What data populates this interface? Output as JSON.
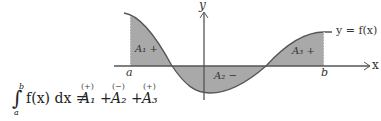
{
  "diagram": {
    "axis_labels": {
      "x": "x",
      "y": "y"
    },
    "curve_label": "y = f(x)",
    "bounds": {
      "a": "a",
      "b": "b"
    },
    "regions": [
      {
        "label": "A₁ +",
        "sign": "+"
      },
      {
        "label": "A₂ −",
        "sign": "−"
      },
      {
        "label": "A₃ +",
        "sign": "+"
      }
    ],
    "fill_color": "#a6a6a6",
    "axis_color": "#555555"
  },
  "equation": {
    "integral": "∫",
    "lower": "a",
    "upper": "b",
    "integrand": "f(x) dx =",
    "terms": [
      "A₁",
      "+",
      "A₂",
      "+",
      "A₃"
    ],
    "signs": [
      "(+)",
      "(−)",
      "(+)"
    ]
  }
}
